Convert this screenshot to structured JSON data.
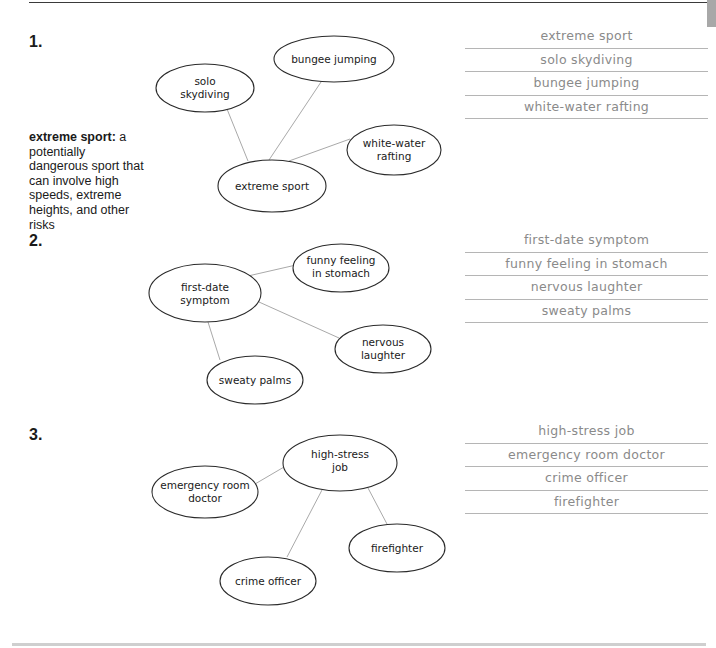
{
  "definition": {
    "term": "extreme sport:",
    "text": "a potentially dangerous sport that can involve high speeds, extreme heights, and other risks"
  },
  "exercises": [
    {
      "number": "1.",
      "center": {
        "line1": "extreme sport",
        "line2": ""
      },
      "nodes": [
        {
          "line1": "solo",
          "line2": "skydiving"
        },
        {
          "line1": "bungee jumping",
          "line2": ""
        },
        {
          "line1": "white-water",
          "line2": "rafting"
        }
      ],
      "answers": [
        "extreme sport",
        "solo skydiving",
        "bungee jumping",
        "white-water rafting"
      ]
    },
    {
      "number": "2.",
      "center": {
        "line1": "first-date",
        "line2": "symptom"
      },
      "nodes": [
        {
          "line1": "funny feeling",
          "line2": "in stomach"
        },
        {
          "line1": "nervous",
          "line2": "laughter"
        },
        {
          "line1": "sweaty palms",
          "line2": ""
        }
      ],
      "answers": [
        "first-date symptom",
        "funny feeling in stomach",
        "nervous laughter",
        "sweaty palms"
      ]
    },
    {
      "number": "3.",
      "center": {
        "line1": "high-stress",
        "line2": "job"
      },
      "nodes": [
        {
          "line1": "emergency room",
          "line2": "doctor"
        },
        {
          "line1": "firefighter",
          "line2": ""
        },
        {
          "line1": "crime officer",
          "line2": ""
        }
      ],
      "answers": [
        "high-stress job",
        "emergency room doctor",
        "crime officer",
        "firefighter"
      ]
    }
  ],
  "colors": {
    "connector": "#a9a9a9",
    "ellipse_stroke": "#2a2a2a",
    "answer_text": "#8a8a8a",
    "answer_rule": "#b5b5b5"
  }
}
